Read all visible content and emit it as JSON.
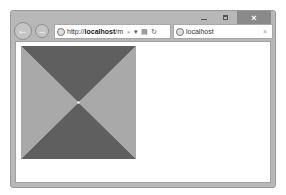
{
  "window": {
    "controls": {
      "minimize_icon": "minimize-icon",
      "maximize_icon": "maximize-icon",
      "close_glyph": "×"
    }
  },
  "toolbar": {
    "back_glyph": "←",
    "forward_glyph": "→",
    "address": {
      "prefix": "http://",
      "host": "localhost",
      "suffix": "/m",
      "search_glyph": "⌕",
      "dropdown_glyph": "▾",
      "compat_glyph": "▤",
      "refresh_glyph": "↻"
    }
  },
  "tab": {
    "title": "localhost",
    "close_glyph": "×"
  },
  "content": {
    "shape": "hourglass-square",
    "colors": {
      "dark": "#5f5f5f",
      "light": "#a9a9a9"
    }
  }
}
